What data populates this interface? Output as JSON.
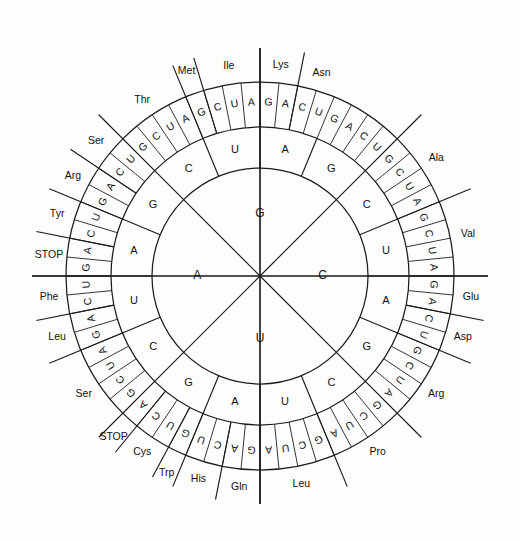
{
  "diagram": {
    "type": "codon-wheel",
    "center": {
      "x": 260,
      "y": 276
    },
    "radii": {
      "inner": 108,
      "middle": 149,
      "outer": 194,
      "label": 212
    },
    "colors": {
      "stroke": "#1b1b1b",
      "text": "#111111",
      "background": "#ffffff"
    },
    "ring1_label": "first base",
    "ring2_label": "second base",
    "ring3_label": "third base",
    "ring1": [
      {
        "base": "G",
        "angle_start": -45,
        "angle_end": 45
      },
      {
        "base": "C",
        "angle_start": 45,
        "angle_end": 135
      },
      {
        "base": "U",
        "angle_start": 135,
        "angle_end": 225
      },
      {
        "base": "A",
        "angle_start": 225,
        "angle_end": 315
      }
    ],
    "ring2": [
      {
        "base": "C",
        "index": 0
      },
      {
        "base": "U",
        "index": 1
      },
      {
        "base": "A",
        "index": 2
      },
      {
        "base": "G",
        "index": 3
      },
      {
        "base": "C",
        "index": 4
      },
      {
        "base": "U",
        "index": 5
      },
      {
        "base": "A",
        "index": 6
      },
      {
        "base": "G",
        "index": 7
      },
      {
        "base": "C",
        "index": 8
      },
      {
        "base": "U",
        "index": 9
      },
      {
        "base": "A",
        "index": 10
      },
      {
        "base": "G",
        "index": 11
      },
      {
        "base": "C",
        "index": 12
      },
      {
        "base": "U",
        "index": 13
      },
      {
        "base": "A",
        "index": 14
      },
      {
        "base": "G",
        "index": 15
      }
    ],
    "groups": [
      {
        "name": "Ala",
        "first": "G",
        "second": "C",
        "thirds": [
          "G",
          "C",
          "U",
          "A"
        ]
      },
      {
        "name": "Val",
        "first": "G",
        "second": "U",
        "thirds": [
          "G",
          "C",
          "U",
          "A"
        ]
      },
      {
        "name": "Glu",
        "first": "G",
        "second": "A",
        "thirds": [
          "G",
          "A"
        ]
      },
      {
        "name": "Asp",
        "first": "G",
        "second": "A",
        "thirds": [
          "C",
          "U"
        ]
      },
      {
        "name": "Arg",
        "first": "C",
        "second": "G",
        "thirds": [
          "G",
          "C",
          "U",
          "A"
        ]
      },
      {
        "name": "Pro",
        "first": "C",
        "second": "C",
        "thirds": [
          "G",
          "C",
          "U",
          "A"
        ]
      },
      {
        "name": "Leu",
        "first": "C",
        "second": "U",
        "thirds": [
          "G",
          "C",
          "U",
          "A"
        ]
      },
      {
        "name": "Gln",
        "first": "C",
        "second": "A",
        "thirds": [
          "G",
          "A"
        ]
      },
      {
        "name": "His",
        "first": "C",
        "second": "A",
        "thirds": [
          "C",
          "U"
        ]
      },
      {
        "name": "Trp",
        "first": "U",
        "second": "G",
        "thirds": [
          "G"
        ]
      },
      {
        "name": "Cys",
        "first": "U",
        "second": "G",
        "thirds": [
          "U",
          "C"
        ]
      },
      {
        "name": "STOP",
        "first": "U",
        "second": "G",
        "thirds": [
          "A"
        ]
      },
      {
        "name": "Ser",
        "first": "U",
        "second": "C",
        "thirds": [
          "G",
          "C",
          "U",
          "A"
        ]
      },
      {
        "name": "Leu",
        "first": "U",
        "second": "U",
        "thirds": [
          "G",
          "A"
        ]
      },
      {
        "name": "Phe",
        "first": "U",
        "second": "U",
        "thirds": [
          "C",
          "U"
        ]
      },
      {
        "name": "STOP",
        "first": "U",
        "second": "A",
        "thirds": [
          "G",
          "A"
        ]
      },
      {
        "name": "Tyr",
        "first": "U",
        "second": "A",
        "thirds": [
          "C",
          "U"
        ]
      },
      {
        "name": "Arg",
        "first": "A",
        "second": "G",
        "thirds": [
          "G",
          "A"
        ]
      },
      {
        "name": "Ser",
        "first": "A",
        "second": "G",
        "thirds": [
          "C",
          "U"
        ]
      },
      {
        "name": "Thr",
        "first": "A",
        "second": "C",
        "thirds": [
          "G",
          "C",
          "U",
          "A"
        ]
      },
      {
        "name": "Met",
        "first": "A",
        "second": "U",
        "thirds": [
          "G"
        ]
      },
      {
        "name": "Ile",
        "first": "A",
        "second": "U",
        "thirds": [
          "C",
          "U",
          "A"
        ]
      },
      {
        "name": "Lys",
        "first": "A",
        "second": "A",
        "thirds": [
          "G",
          "A"
        ]
      },
      {
        "name": "Asn",
        "first": "A",
        "second": "A",
        "thirds": [
          "C",
          "U"
        ]
      }
    ],
    "ring3_sequence": [
      "G",
      "C",
      "U",
      "A",
      "G",
      "C",
      "U",
      "A",
      "G",
      "A",
      "C",
      "U",
      "G",
      "C",
      "U",
      "A",
      "G",
      "C",
      "U",
      "A",
      "G",
      "C",
      "U",
      "A",
      "G",
      "A",
      "C",
      "U",
      "G",
      "U",
      "C",
      "A",
      "G",
      "C",
      "U",
      "A",
      "G",
      "A",
      "C",
      "U",
      "G",
      "A",
      "C",
      "U",
      "G",
      "A",
      "C",
      "U",
      "G",
      "C",
      "U",
      "A",
      "G",
      "C",
      "U",
      "A",
      "G",
      "A",
      "C",
      "U",
      "G",
      "A",
      "C",
      "U"
    ],
    "aa_ring_labels": [
      "Ala",
      "Val",
      "Glu",
      "Asp",
      "Arg",
      "Pro",
      "Leu",
      "Gln",
      "His",
      "Trp",
      "Cys",
      "STOP",
      "Ser",
      "Leu",
      "Phe",
      "STOP",
      "Tyr",
      "Arg",
      "Ser",
      "Thr",
      "Met",
      "Ile",
      "Lys",
      "Asn"
    ]
  }
}
